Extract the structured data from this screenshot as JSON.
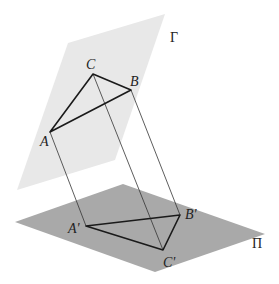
{
  "diagram": {
    "planes": [
      {
        "id": "gamma",
        "label": "Γ",
        "color": "#e8e8e8",
        "points": [
          [
            68,
            43
          ],
          [
            165,
            14
          ],
          [
            115,
            160
          ],
          [
            17,
            190
          ]
        ],
        "label_pos": [
          170,
          42
        ]
      },
      {
        "id": "pi",
        "label": "Π",
        "color": "#a9a9a9",
        "points": [
          [
            15,
            222
          ],
          [
            123,
            184
          ],
          [
            265,
            234
          ],
          [
            155,
            272
          ]
        ],
        "label_pos": [
          252,
          248
        ]
      }
    ],
    "points": {
      "A": {
        "label": "A",
        "xy": [
          50,
          132
        ],
        "label_pos": [
          40,
          146
        ]
      },
      "B": {
        "label": "B",
        "xy": [
          131,
          90
        ],
        "label_pos": [
          130,
          86
        ]
      },
      "C": {
        "label": "C",
        "xy": [
          93,
          74
        ],
        "label_pos": [
          86,
          69
        ]
      },
      "A'": {
        "label": "A'",
        "xy": [
          86,
          226
        ],
        "label_pos": [
          68,
          233
        ]
      },
      "B'": {
        "label": "B'",
        "xy": [
          180,
          215
        ],
        "label_pos": [
          185,
          219
        ]
      },
      "C'": {
        "label": "C'",
        "xy": [
          163,
          250
        ],
        "label_pos": [
          163,
          267
        ]
      }
    },
    "triangle_top": [
      "A",
      "B",
      "C"
    ],
    "triangle_bottom": [
      "A'",
      "B'",
      "C'"
    ],
    "projection_lines": [
      [
        "A",
        "A'"
      ],
      [
        "B",
        "B'"
      ],
      [
        "C",
        "C'"
      ]
    ],
    "colors": {
      "edge": "#1a1a1a",
      "projection": "#333333"
    }
  }
}
